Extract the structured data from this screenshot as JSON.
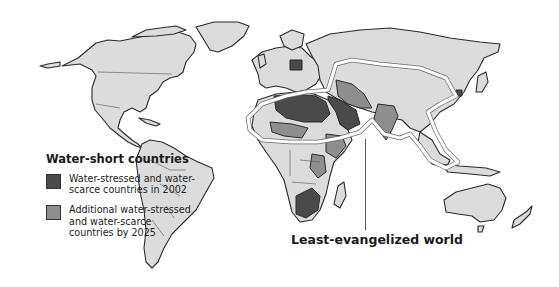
{
  "map": {
    "title": "Water-short countries and the least-evangelized world",
    "colors": {
      "land": "#dcdcdc",
      "outline": "#2b2b2b",
      "water_stressed_2002": "#4a4a4a",
      "water_stressed_2025": "#8e8e8e",
      "least_evangelized_outline": "#ffffff",
      "background": "#ffffff"
    }
  },
  "legend": {
    "title": "Water-short countries",
    "items": [
      {
        "label": "Water-stressed and water-scarce countries in 2002",
        "color": "#4a4a4a"
      },
      {
        "label": "Additional water-stressed and water-scarce countries by 2025",
        "color": "#8e8e8e"
      }
    ]
  },
  "callout": {
    "label": "Least-evangelized world"
  }
}
